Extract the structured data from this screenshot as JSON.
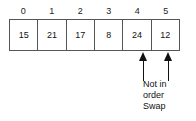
{
  "figure": {
    "name": "array-swap-diagram",
    "array": {
      "indices": [
        "0",
        "1",
        "2",
        "3",
        "4",
        "5"
      ],
      "values": [
        "15",
        "21",
        "17",
        "8",
        "24",
        "12"
      ]
    },
    "markers": [
      {
        "name": "arrow-index-4",
        "points_to_index": "4"
      },
      {
        "name": "arrow-index-5",
        "points_to_index": "5"
      }
    ],
    "caption": {
      "lines": [
        "Not in",
        "order",
        "Swap"
      ],
      "line1": "Not in",
      "line2": "order",
      "line3": "Swap"
    },
    "colors": {
      "background": "#ffffff",
      "border": "#555555",
      "text": "#111111",
      "arrow": "#111111"
    }
  }
}
